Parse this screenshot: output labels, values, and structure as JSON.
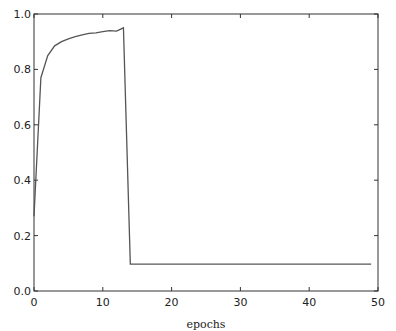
{
  "chart_data": {
    "type": "line",
    "title": "",
    "xlabel": "epochs",
    "ylabel": "",
    "xlim": [
      0,
      50
    ],
    "ylim": [
      0.0,
      1.0
    ],
    "grid": false,
    "legend": null,
    "x_ticks": [
      "0",
      "10",
      "20",
      "30",
      "40",
      "50"
    ],
    "y_ticks": [
      "0.0",
      "0.2",
      "0.4",
      "0.6",
      "0.8",
      "1.0"
    ],
    "series": [
      {
        "name": "series-1",
        "color": "#555555",
        "x": [
          0,
          1,
          2,
          3,
          4,
          5,
          6,
          7,
          8,
          9,
          10,
          11,
          12,
          13,
          14,
          15,
          16,
          17,
          18,
          19,
          20,
          21,
          22,
          23,
          24,
          25,
          26,
          27,
          28,
          29,
          30,
          31,
          32,
          33,
          34,
          35,
          36,
          37,
          38,
          39,
          40,
          41,
          42,
          43,
          44,
          45,
          46,
          47,
          48,
          49
        ],
        "values": [
          0.27,
          0.77,
          0.85,
          0.885,
          0.9,
          0.91,
          0.918,
          0.925,
          0.93,
          0.932,
          0.936,
          0.94,
          0.938,
          0.95,
          0.097,
          0.097,
          0.097,
          0.097,
          0.097,
          0.097,
          0.097,
          0.097,
          0.097,
          0.097,
          0.097,
          0.097,
          0.097,
          0.097,
          0.097,
          0.097,
          0.097,
          0.097,
          0.097,
          0.097,
          0.097,
          0.097,
          0.097,
          0.097,
          0.097,
          0.097,
          0.097,
          0.097,
          0.097,
          0.097,
          0.097,
          0.097,
          0.097,
          0.097,
          0.097,
          0.097
        ]
      }
    ]
  }
}
